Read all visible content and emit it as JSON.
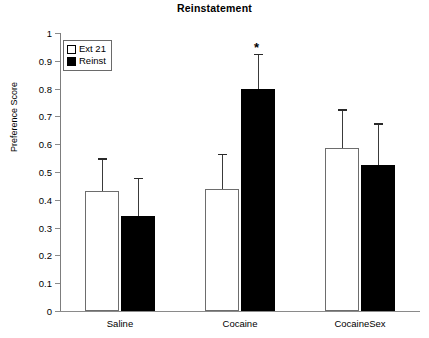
{
  "chart_data": {
    "type": "bar",
    "title": "Reinstatement",
    "xlabel": "",
    "ylabel": "Preference Score",
    "categories": [
      "Saline",
      "Cocaine",
      "CocaineSex"
    ],
    "ylim": [
      0,
      1
    ],
    "ytick_labels": [
      "1",
      "0.9",
      "0.8",
      "0.7",
      "0.6",
      "0.5",
      "0.4",
      "0.3",
      "0.2",
      "0.1",
      "0"
    ],
    "ytick_values": [
      1,
      0.9,
      0.8,
      0.7,
      0.6,
      0.5,
      0.4,
      0.3,
      0.2,
      0.1,
      0
    ],
    "grid": false,
    "legend_position": "top-left",
    "series": [
      {
        "name": "Ext 21",
        "style": "open",
        "color": "#ffffff",
        "values": [
          0.43,
          0.44,
          0.585
        ],
        "errors_upper": [
          0.55,
          0.565,
          0.725
        ]
      },
      {
        "name": "Reinst",
        "style": "filled",
        "color": "#000000",
        "values": [
          0.34,
          0.8,
          0.525
        ],
        "errors_upper": [
          0.48,
          0.925,
          0.675
        ]
      }
    ],
    "annotations": [
      {
        "text": "*",
        "category": "Cocaine",
        "series": "Reinst",
        "value": 0.97,
        "meaning": "significance-marker"
      }
    ]
  }
}
